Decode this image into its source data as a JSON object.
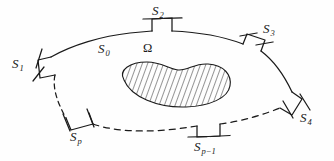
{
  "figure": {
    "background_color": "#fefefe",
    "stroke_color": "#1a1a1a",
    "hatch_color": "#2b2b2b",
    "domain_label": {
      "base": "Ω",
      "sub": ""
    },
    "boundary_labels": [
      {
        "id": "S0",
        "base": "S",
        "sub": "0",
        "x": 98,
        "y": 42
      },
      {
        "id": "S1",
        "base": "S",
        "sub": "1",
        "x": 13,
        "y": 57
      },
      {
        "id": "S2",
        "base": "S",
        "sub": "2",
        "x": 152,
        "y": 4
      },
      {
        "id": "S3",
        "base": "S",
        "sub": "3",
        "x": 262,
        "y": 22
      },
      {
        "id": "S4",
        "base": "S",
        "sub": "4",
        "x": 299,
        "y": 110
      },
      {
        "id": "Sp",
        "base": "S",
        "sub": "p",
        "x": 70,
        "y": 129
      },
      {
        "id": "Spm1",
        "base": "S",
        "sub": "p−1",
        "x": 196,
        "y": 138
      }
    ],
    "omega": {
      "x": 144,
      "y": 41
    },
    "elements": {
      "outer_boundary": "outer-boundary-curve",
      "inner_hole": "hatched-inner-region",
      "dashed_arcs": "dashed-boundary-arcs",
      "tick_marks": "boundary-tick-marks"
    }
  }
}
